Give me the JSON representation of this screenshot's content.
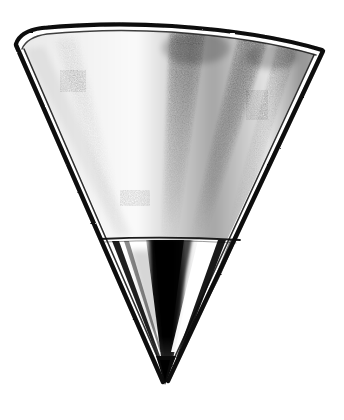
{
  "image": {
    "subject": "conical funnel",
    "style": "black-and-white engraving line art",
    "alt_text": "Black and white engraved illustration of a conical metal funnel seen from the side, wide elliptical rim at the top tapering to a sharp point at the bottom",
    "background_color": "#ffffff",
    "ink_color": "#000000",
    "canvas": {
      "width": 344,
      "height": 420
    }
  },
  "geometry": {
    "rim": {
      "left_x": 16,
      "right_x": 324,
      "center_x": 170,
      "top_y": 27,
      "left_y": 44,
      "right_y": 52,
      "ellipse_rx": 154,
      "ellipse_ry": 18
    },
    "tip": {
      "x": 165,
      "y": 384
    },
    "transition_line": {
      "left_x": 100,
      "right_x": 240,
      "y": 239
    },
    "wall_thickness_px": 7
  },
  "shading": {
    "streaks": [
      {
        "name": "center-streak",
        "top_x": 186,
        "bottom_x": 166,
        "top_width": 34,
        "bottom_width": 12,
        "opacity": 0.4
      },
      {
        "name": "right-streak",
        "top_x": 252,
        "bottom_x": 196,
        "top_width": 26,
        "bottom_width": 10,
        "opacity": 0.45
      },
      {
        "name": "far-right-streak",
        "top_x": 286,
        "bottom_x": 228,
        "top_width": 16,
        "bottom_width": 8,
        "opacity": 0.3
      },
      {
        "name": "left-faint-streak",
        "top_x": 64,
        "bottom_x": 118,
        "top_width": 18,
        "bottom_width": 10,
        "opacity": 0.16
      }
    ],
    "inner_cone": {
      "name": "dark-inner-cone-shadow",
      "top_left_x": 150,
      "top_right_x": 196,
      "tip_x": 168,
      "top_y": 240,
      "tip_y": 380,
      "darkness": 0.95
    },
    "highlight": {
      "name": "inner-cone-highlight",
      "description": "bright white wedge to the right of the dark inner cone"
    }
  },
  "labels": {
    "figure_note": ""
  }
}
